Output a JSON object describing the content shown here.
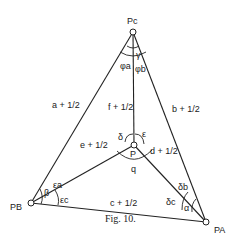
{
  "diagram": {
    "vertices": {
      "pc": "Pc",
      "pb": "PB",
      "pa": "PA",
      "p": "P"
    },
    "edges": {
      "a": "a + 1/2",
      "b": "b + 1/2",
      "c": "c + 1/2",
      "d": "d + 1/2",
      "e": "e + 1/2",
      "f": "f + 1/2"
    },
    "angles": {
      "gamma": "γ",
      "phi_a": "φa",
      "phi_b": "φb",
      "beta": "β",
      "eps_a": "εa",
      "eps_c": "εc",
      "alpha": "α",
      "delta_b": "δb",
      "delta_c": "δc",
      "delta": "δ",
      "epsilon": "ε",
      "q": "q"
    },
    "caption": "Fig. 10."
  }
}
